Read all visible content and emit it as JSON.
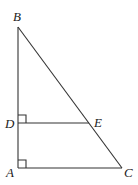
{
  "figure": {
    "type": "geometry-triangle",
    "points": {
      "A": {
        "label": "A"
      },
      "B": {
        "label": "B"
      },
      "C": {
        "label": "C"
      },
      "D": {
        "label": "D"
      },
      "E": {
        "label": "E"
      }
    },
    "segments": [
      "AB",
      "BC",
      "AC",
      "DE"
    ],
    "right_angles": [
      "D",
      "A"
    ],
    "relations": [
      "DE ⊥ AB",
      "AC ⊥ AB",
      "D on AB",
      "E on BC"
    ]
  }
}
